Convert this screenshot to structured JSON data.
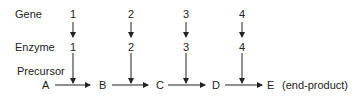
{
  "labels": {
    "gene": "Gene",
    "enzyme": "Enzyme",
    "precursor": "Precursor"
  },
  "genes": [
    "1",
    "2",
    "3",
    "4"
  ],
  "enzymes": [
    "1",
    "2",
    "3",
    "4"
  ],
  "metabolites": [
    "A",
    "B",
    "C",
    "D",
    "E"
  ],
  "end_note": "(end-product)"
}
